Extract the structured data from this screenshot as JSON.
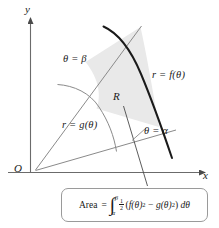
{
  "figure": {
    "type": "polar-area-diagram",
    "axes": {
      "y_label": "y",
      "x_label": "x",
      "origin_label": "O"
    },
    "curves": {
      "outer_label": "r = f(θ)",
      "inner_label": "r = g(θ)"
    },
    "rays": {
      "upper_label": "θ = β",
      "lower_label": "θ = α"
    },
    "region": {
      "label": "R",
      "fill_color": "#e9e9e9"
    },
    "formula": {
      "word": "Area",
      "equals": "=",
      "integral_sign": "∫",
      "limit_upper": "β",
      "limit_lower": "α",
      "frac_numerator": "1",
      "frac_denominator": "2",
      "open_paren": "(",
      "term_one_base": "f(θ)",
      "term_one_exponent": "2",
      "minus": "−",
      "term_two_base": "g(θ)",
      "term_two_exponent": "2",
      "close_paren": ")",
      "differential": "dθ",
      "plain_text": "Area = ∫ₐ^β ½(f(θ)² − g(θ)²) dθ"
    },
    "colors": {
      "axis": "#6b6b6b",
      "thin_curve": "#8a8a8a",
      "thick_curve": "#1a1a1a",
      "shading": "#e9e9e9",
      "box_border": "#9a9a9a",
      "text": "#1a1a1a"
    }
  }
}
